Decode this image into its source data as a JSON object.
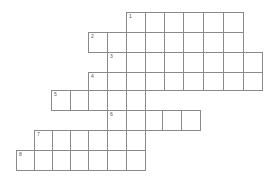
{
  "puzzle": {
    "type": "crossword",
    "cell_color": "#ffffff",
    "line_color": "#8a8a8a",
    "rows": [
      {
        "number": "1",
        "y": 12,
        "h": 20,
        "xs": [
          126,
          145,
          164,
          183,
          203,
          223,
          243
        ]
      },
      {
        "number": "2",
        "y": 32,
        "h": 20,
        "xs": [
          88,
          107,
          126,
          145,
          164,
          183,
          203,
          223,
          243
        ]
      },
      {
        "number": "3",
        "y": 52,
        "h": 20,
        "xs": [
          107,
          126,
          145,
          164,
          183,
          203,
          223,
          243,
          262
        ]
      },
      {
        "number": "4",
        "y": 72,
        "h": 18,
        "xs": [
          88,
          107,
          126,
          145,
          164,
          183,
          203,
          223,
          243,
          262
        ]
      },
      {
        "number": "5",
        "y": 90,
        "h": 20,
        "xs": [
          51,
          70,
          88,
          107,
          126,
          145
        ]
      },
      {
        "number": "6",
        "y": 110,
        "h": 20,
        "xs": [
          107,
          126,
          145,
          162,
          181,
          200
        ]
      },
      {
        "number": "7",
        "y": 130,
        "h": 20,
        "xs": [
          34,
          52,
          70,
          88,
          107,
          126,
          145
        ]
      },
      {
        "number": "8",
        "y": 150,
        "h": 20,
        "xs": [
          16,
          34,
          52,
          70,
          88,
          107,
          126,
          145
        ]
      }
    ]
  }
}
